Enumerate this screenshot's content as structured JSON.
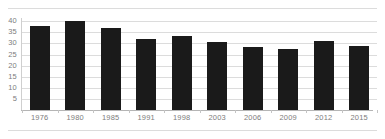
{
  "chart_data": {
    "type": "bar",
    "title": "",
    "subtitle": "",
    "xlabel": "",
    "ylabel": "",
    "categories": [
      "1976",
      "1980",
      "1985",
      "1991",
      "1998",
      "2003",
      "2006",
      "2009",
      "2012",
      "2015"
    ],
    "values": [
      38,
      40,
      37,
      32,
      33.5,
      30.5,
      28.5,
      27.5,
      31,
      29
    ],
    "series": [
      {
        "name": "",
        "values": [
          38,
          40,
          37,
          32,
          33.5,
          30.5,
          28.5,
          27.5,
          31,
          29
        ]
      }
    ],
    "ylim": [
      0,
      41.5
    ],
    "yticks": [
      5,
      10,
      15,
      20,
      25,
      30,
      35,
      40
    ],
    "ytick_labels": [
      "5",
      "10",
      "15",
      "20",
      "25",
      "30",
      "35",
      "40"
    ],
    "xticks": [
      "1976",
      "1980",
      "1985",
      "1991",
      "1998",
      "2003",
      "2006",
      "2009",
      "2012",
      "2015"
    ],
    "grid": true,
    "grid_axis": "y",
    "legend": false,
    "legend_position": "none",
    "annotations": [],
    "data_labels": false
  },
  "style": {
    "bar_color": "#1a1a1a",
    "grid_color": "#dcdcdc",
    "axis_color": "#b5b5b5",
    "tick_label_color": "#7d7d7d",
    "background": "#ffffff"
  }
}
